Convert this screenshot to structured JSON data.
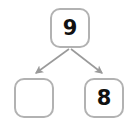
{
  "diagram": {
    "type": "tree",
    "canvas": {
      "width": 138,
      "height": 126,
      "background": "#ffffff"
    },
    "style": {
      "node_border_color": "#b2b2b2",
      "node_fill_color": "#ffffff",
      "node_border_width": 2,
      "node_corner_radius": 10,
      "edge_color": "#9a9a9a",
      "edge_width": 1.6,
      "text_color": "#111111"
    },
    "nodes": [
      {
        "id": "root",
        "label": "9",
        "empty": false,
        "x": 50,
        "y": 8,
        "width": 40,
        "height": 40
      },
      {
        "id": "left-child",
        "label": "",
        "empty": true,
        "x": 14,
        "y": 78,
        "width": 40,
        "height": 40
      },
      {
        "id": "right-child",
        "label": "8",
        "empty": false,
        "x": 84,
        "y": 78,
        "width": 40,
        "height": 40
      }
    ],
    "edges": [
      {
        "id": "root-to-left",
        "from": "root",
        "to": "left-child",
        "arrowhead": "triangle",
        "direction": "down-left"
      },
      {
        "id": "root-to-right",
        "from": "root",
        "to": "right-child",
        "arrowhead": "triangle",
        "direction": "down-right"
      }
    ]
  }
}
